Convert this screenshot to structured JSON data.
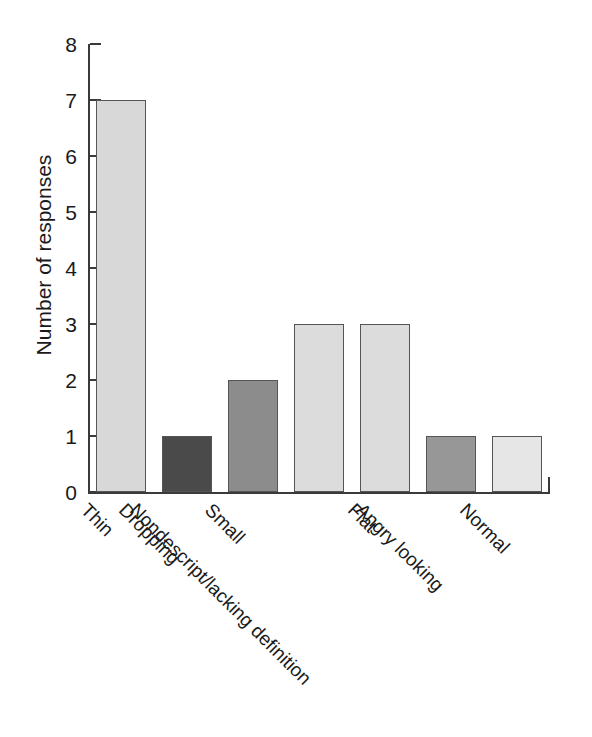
{
  "chart_data": {
    "type": "bar",
    "title": "",
    "xlabel": "",
    "ylabel": "Number of responses",
    "categories": [
      "Thin",
      "Dropping",
      "Small",
      "Nondescript/lacking definition",
      "Flat",
      "Angry looking",
      "Normal"
    ],
    "values": [
      7,
      1,
      2,
      3,
      3,
      1,
      1
    ],
    "ylim": [
      0,
      8
    ],
    "yticks": [
      0,
      1,
      2,
      3,
      4,
      5,
      6,
      7,
      8
    ],
    "ytick_labels": [
      "0",
      "1",
      "2",
      "3",
      "4",
      "5",
      "6",
      "7",
      "8"
    ],
    "grid": false,
    "legend": null,
    "bar_colors": [
      "#d8d8d8",
      "#4a4a4a",
      "#8c8c8c",
      "#dcdcdc",
      "#dcdcdc",
      "#979797",
      "#e6e6e6"
    ],
    "bar_edge_color": "#555555",
    "axis_color": "#3a3a3a",
    "background_color": "#ffffff"
  }
}
